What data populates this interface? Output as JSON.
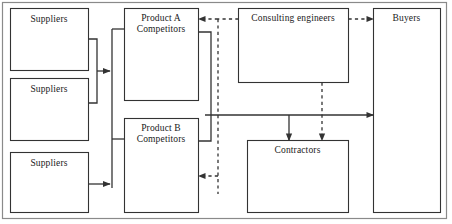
{
  "figure": {
    "frame": {
      "name": "outer-frame",
      "x": 2,
      "y": 2,
      "width": 445,
      "height": 217
    },
    "stroke_color": "#333333",
    "background_color": "#ffffff",
    "text_color": "#1a1a1a"
  },
  "nodes": [
    {
      "id": "supplier-1",
      "label": "Suppliers",
      "x": 10,
      "y": 8,
      "width": 78,
      "height": 62
    },
    {
      "id": "supplier-2",
      "label": "Suppliers",
      "x": 10,
      "y": 78,
      "width": 78,
      "height": 62
    },
    {
      "id": "supplier-3",
      "label": "Suppliers",
      "x": 10,
      "y": 152,
      "width": 78,
      "height": 60
    },
    {
      "id": "product-a-competitors",
      "label": "Product A\nCompetitors",
      "x": 124,
      "y": 8,
      "width": 74,
      "height": 92
    },
    {
      "id": "product-b-competitors",
      "label": "Product B\nCompetitors",
      "x": 124,
      "y": 118,
      "width": 74,
      "height": 94
    },
    {
      "id": "consulting-engineers",
      "label": "Consulting engineers",
      "x": 238,
      "y": 8,
      "width": 110,
      "height": 74
    },
    {
      "id": "contractors",
      "label": "Contractors",
      "x": 247,
      "y": 140,
      "width": 101,
      "height": 72
    },
    {
      "id": "buyers",
      "label": "Buyers",
      "x": 373,
      "y": 8,
      "width": 67,
      "height": 204
    }
  ],
  "edges": [
    {
      "id": "suppliers-1-2-to-trunk",
      "style": "solid",
      "arrow": true,
      "from": "supplier-1, supplier-2",
      "to": "competitor-trunk"
    },
    {
      "id": "supplier-3-to-trunk",
      "style": "solid",
      "arrow": true,
      "from": "supplier-3",
      "to": "competitor-trunk"
    },
    {
      "id": "trunk-to-product-a",
      "style": "solid",
      "arrow": false,
      "from": "competitor-trunk",
      "to": "product-a-competitors"
    },
    {
      "id": "trunk-to-product-b",
      "style": "solid",
      "arrow": false,
      "from": "competitor-trunk",
      "to": "product-b-competitors"
    },
    {
      "id": "products-to-buyers",
      "style": "solid",
      "arrow": true,
      "from": "product-a-competitors, product-b-competitors",
      "to": "buyers"
    },
    {
      "id": "products-to-contractors",
      "style": "solid",
      "arrow": true,
      "from": "product-a-competitors, product-b-competitors",
      "to": "contractors"
    },
    {
      "id": "consulting-to-product-a",
      "style": "dashed",
      "arrow": true,
      "from": "consulting-engineers",
      "to": "product-a-competitors"
    },
    {
      "id": "consulting-to-product-b",
      "style": "dashed",
      "arrow": true,
      "from": "consulting-engineers",
      "to": "product-b-competitors"
    },
    {
      "id": "consulting-to-buyers",
      "style": "dashed",
      "arrow": true,
      "from": "consulting-engineers",
      "to": "buyers"
    },
    {
      "id": "consulting-to-contractors",
      "style": "dashed",
      "arrow": true,
      "from": "consulting-engineers",
      "to": "contractors"
    }
  ]
}
